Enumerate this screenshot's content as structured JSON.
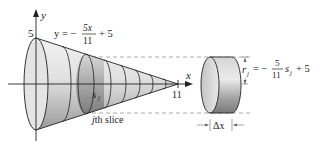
{
  "diagram": {
    "type": "solid-of-revolution-disk-method",
    "axes": {
      "x_label": "x",
      "y_label": "y",
      "y_intercept_label": "5",
      "x_intercept_label": "11"
    },
    "curve_equation": {
      "lhs": "y = −",
      "numerator": "5x",
      "denominator": "11",
      "rhs": "+ 5"
    },
    "slice": {
      "sample_point_label": "s",
      "sample_point_subscript": "j",
      "caption": "jth slice",
      "caption_j": "j",
      "caption_rest": "th slice"
    },
    "disk": {
      "radius_label": "r",
      "radius_subscript": "j",
      "radius_formula_prefix": "= −",
      "radius_numerator": "5",
      "radius_denominator": "11",
      "radius_formula_var": "s",
      "radius_formula_var_subscript": "j",
      "radius_formula_suffix": "+ 5",
      "thickness_label": "Δx"
    },
    "colors": {
      "line": "#222222",
      "fill_light": "#e6e6e6",
      "fill_mid": "#b8b8b8",
      "fill_dark": "#8a8a8a",
      "dashed": "#888888"
    }
  }
}
